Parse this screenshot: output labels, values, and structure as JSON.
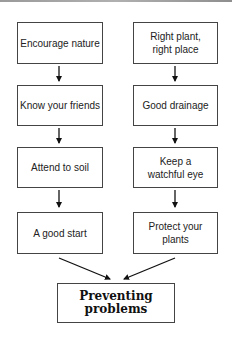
{
  "diagram": {
    "title": "Preventing problems",
    "left_column": [
      {
        "label": "Encourage nature"
      },
      {
        "label": "Know your friends"
      },
      {
        "label": "Attend to soil"
      },
      {
        "label": "A good start"
      }
    ],
    "right_column": [
      {
        "label": "Right plant,\nright place"
      },
      {
        "label": "Good drainage"
      },
      {
        "label": "Keep a\nwatchful eye"
      },
      {
        "label": "Protect your plants"
      }
    ],
    "final": {
      "label": "Preventing problems"
    },
    "colors": {
      "border": "#444444",
      "arrow": "#111111",
      "background": "#ffffff"
    }
  }
}
